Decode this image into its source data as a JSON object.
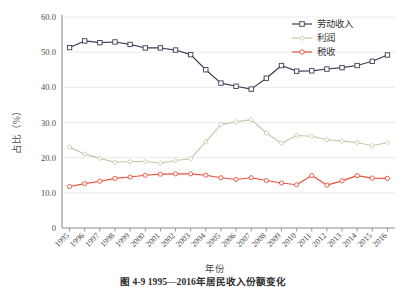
{
  "chart_data": {
    "type": "line",
    "title": "",
    "xlabel": "年份",
    "ylabel": "占比（%）",
    "ylim": [
      0,
      60
    ],
    "yticks": [
      "0",
      "10.0",
      "20.0",
      "30.0",
      "40.0",
      "50.0",
      "60.0"
    ],
    "ytick_values": [
      0,
      10,
      20,
      30,
      40,
      50,
      60
    ],
    "grid": true,
    "legend_position": "top-right",
    "categories": [
      "1995",
      "1996",
      "1997",
      "1998",
      "1999",
      "2000",
      "2001",
      "2002",
      "2003",
      "2004",
      "2005",
      "2006",
      "2007",
      "2008",
      "2009",
      "2010",
      "2011",
      "2012",
      "2013",
      "2014",
      "2015",
      "2016"
    ],
    "series": [
      {
        "name": "劳动收入",
        "color": "#3b3b52",
        "marker": "square",
        "values": [
          51.3,
          53.2,
          52.7,
          52.9,
          52.2,
          51.2,
          51.2,
          50.6,
          49.3,
          45.0,
          41.2,
          40.3,
          39.5,
          42.6,
          46.2,
          44.6,
          44.7,
          45.2,
          45.6,
          46.2,
          47.4,
          49.2
        ]
      },
      {
        "name": "利润",
        "color": "#cdc3a8",
        "marker": "diamond",
        "values": [
          23.0,
          21.0,
          19.8,
          18.7,
          18.9,
          18.9,
          18.4,
          19.2,
          19.7,
          24.5,
          29.4,
          30.2,
          30.8,
          27.0,
          24.1,
          26.3,
          26.1,
          25.1,
          24.7,
          24.3,
          23.4,
          24.3
        ]
      },
      {
        "name": "税收",
        "color": "#e8503a",
        "marker": "circle",
        "values": [
          11.8,
          12.6,
          13.3,
          14.1,
          14.5,
          15.0,
          15.3,
          15.4,
          15.4,
          15.0,
          14.3,
          13.8,
          14.3,
          13.5,
          12.8,
          12.3,
          14.9,
          12.2,
          13.4,
          14.9,
          14.2,
          14.1
        ]
      }
    ]
  },
  "legend": {
    "items": [
      {
        "label": "劳动收入"
      },
      {
        "label": "利润"
      },
      {
        "label": "税收"
      }
    ]
  },
  "caption": {
    "text": "图 4-9  1995—2016年居民收入份额变化"
  }
}
